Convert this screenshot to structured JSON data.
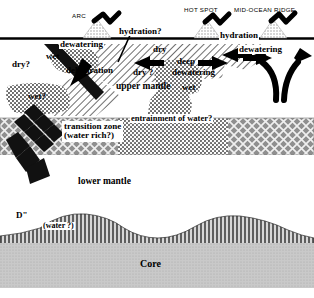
{
  "figure": {
    "type": "geological-cross-section",
    "title_visible": false
  },
  "surface_features": [
    {
      "id": "arc",
      "label": "ARC",
      "x": 72,
      "y": 14,
      "volcano_x": 97
    },
    {
      "id": "hot-spot",
      "label": "HOT SPOT",
      "x": 185,
      "y": 8,
      "volcano_x": 207
    },
    {
      "id": "mid-ocean-ridge",
      "label": "MID-OCEAN RIDGE",
      "x": 237,
      "y": 8,
      "volcano_x": 273
    }
  ],
  "process_labels": [
    {
      "id": "hydration-arc",
      "text": "hydration?",
      "x": 122,
      "y": 31
    },
    {
      "id": "hydration-ridge",
      "text": "hydration",
      "x": 222,
      "y": 35
    },
    {
      "id": "dewatering-arc",
      "text": "dewatering",
      "x": 62,
      "y": 43
    },
    {
      "id": "dewatering-ridge",
      "text": "dewatering",
      "x": 241,
      "y": 48
    },
    {
      "id": "dehydration",
      "text": "dehydration",
      "x": 68,
      "y": 69
    },
    {
      "id": "deep",
      "text": "deep",
      "x": 179,
      "y": 60
    },
    {
      "id": "deep-dewatering",
      "text": "dewatering",
      "x": 175,
      "y": 70
    },
    {
      "id": "entrainment",
      "text": "entrainment of water?",
      "x": 133,
      "y": 118
    }
  ],
  "state_labels": [
    {
      "id": "dry-left",
      "text": "dry?",
      "x": 14,
      "y": 63
    },
    {
      "id": "wet-slabtop",
      "text": "wet",
      "x": 47,
      "y": 56
    },
    {
      "id": "dry-wedge",
      "text": "dry",
      "x": 155,
      "y": 48
    },
    {
      "id": "dry-question",
      "text": "dry ?",
      "x": 135,
      "y": 71
    },
    {
      "id": "wet-question",
      "text": "wet?",
      "x": 30,
      "y": 96
    },
    {
      "id": "wet-plume",
      "text": "wet",
      "x": 184,
      "y": 86
    }
  ],
  "layer_labels": [
    {
      "id": "upper-mantle",
      "text": "upper mantle",
      "x": 118,
      "y": 85
    },
    {
      "id": "transition-zone-line1",
      "text": "transition zone",
      "x": 66,
      "y": 127
    },
    {
      "id": "transition-zone-line2",
      "text": "(water rich?)",
      "x": 66,
      "y": 138
    },
    {
      "id": "lower-mantle",
      "text": "lower mantle",
      "x": 80,
      "y": 180
    },
    {
      "id": "d-double-prime",
      "text": "D\"",
      "x": 18,
      "y": 215
    },
    {
      "id": "d-layer-water",
      "text": "(water ?)",
      "x": 45,
      "y": 226
    },
    {
      "id": "core",
      "text": "Core",
      "x": 143,
      "y": 263
    }
  ],
  "colors": {
    "background": "#ffffff",
    "ink": "#000000",
    "surface_line": "#000000",
    "upper_mantle_fill": "#ffffff",
    "transition_zone": "#8a8a8a",
    "core_fill": "#bdbdbd",
    "stipple": "#6e6e6e",
    "slab_dark": "#111111"
  },
  "structures": {
    "surface_line_y": 38,
    "transition_zone_top": 118,
    "transition_zone_bottom": 155,
    "core_top": 240,
    "plume_label": "mantle-plume-column",
    "slab_label": "subducting-slab"
  }
}
